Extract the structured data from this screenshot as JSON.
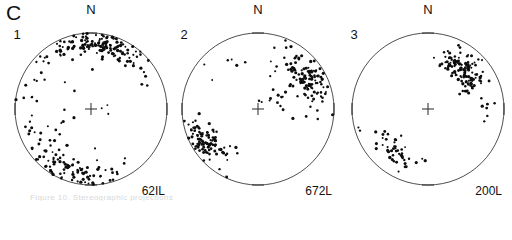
{
  "figure": {
    "panel_letter": "C",
    "background_color": "#ffffff",
    "line_color": "#3a3a3a",
    "point_color": "#0d0d0d",
    "cut_caption": "Figure 10. Stereographic projections"
  },
  "chart_data": {
    "type": "scatter",
    "title": "C",
    "subtitle": "",
    "xlabel": "",
    "ylabel": "",
    "projection": "equal-area stereonet (lower hemisphere)",
    "grid": false,
    "legend_position": "none",
    "axis_ticks": [
      "N",
      "E",
      "S",
      "W"
    ],
    "tick_label_shown": "N",
    "xlim": [
      -1,
      1
    ],
    "ylim": [
      -1,
      1
    ],
    "panels": [
      {
        "number": "1",
        "sample_label": "62IL",
        "north_label": "N",
        "n_points": 268,
        "clusters": [
          {
            "name": "north-girdle",
            "center_az_deg": 2,
            "center_r": 0.87,
            "count": 150,
            "spread_az_deg": 62,
            "spread_r": 0.15
          },
          {
            "name": "south-southwest-girdle",
            "center_az_deg": 196,
            "center_r": 0.86,
            "count": 86,
            "spread_az_deg": 48,
            "spread_r": 0.17
          },
          {
            "name": "west-scatter",
            "center_az_deg": 250,
            "center_r": 0.72,
            "count": 22,
            "spread_az_deg": 40,
            "spread_r": 0.26
          },
          {
            "name": "interior-sparse",
            "center_az_deg": 320,
            "center_r": 0.35,
            "count": 10,
            "spread_az_deg": 180,
            "spread_r": 0.3
          }
        ]
      },
      {
        "number": "2",
        "sample_label": "672L",
        "north_label": "N",
        "n_points": 243,
        "clusters": [
          {
            "name": "northeast-cluster",
            "center_az_deg": 58,
            "center_r": 0.78,
            "count": 118,
            "spread_az_deg": 34,
            "spread_r": 0.22
          },
          {
            "name": "southwest-cluster",
            "center_az_deg": 238,
            "center_r": 0.82,
            "count": 105,
            "spread_az_deg": 26,
            "spread_r": 0.2
          },
          {
            "name": "center-trail",
            "center_az_deg": 52,
            "center_r": 0.3,
            "count": 14,
            "spread_az_deg": 46,
            "spread_r": 0.22
          },
          {
            "name": "northwest-sparse",
            "center_az_deg": 330,
            "center_r": 0.8,
            "count": 6,
            "spread_az_deg": 60,
            "spread_r": 0.2
          }
        ]
      },
      {
        "number": "3",
        "sample_label": "200L",
        "north_label": "N",
        "n_points": 180,
        "clusters": [
          {
            "name": "northeast-dense-cluster",
            "center_az_deg": 42,
            "center_r": 0.72,
            "count": 128,
            "spread_az_deg": 28,
            "spread_r": 0.21
          },
          {
            "name": "southwest-scatter",
            "center_az_deg": 218,
            "center_r": 0.74,
            "count": 46,
            "spread_az_deg": 34,
            "spread_r": 0.26
          },
          {
            "name": "east-sparse",
            "center_az_deg": 95,
            "center_r": 0.8,
            "count": 6,
            "spread_az_deg": 22,
            "spread_r": 0.12
          }
        ]
      }
    ]
  }
}
